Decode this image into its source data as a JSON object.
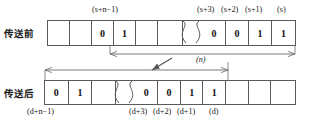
{
  "figure": {
    "rows": [
      {
        "name": "before",
        "label": "传送前",
        "cells": [
          "",
          "",
          "0",
          "1",
          "",
          "",
          "BREAK",
          "0",
          "0",
          "1",
          "1"
        ],
        "tick_labels_above": [
          "(s+n−1)",
          "(s+3)",
          "(s+2)",
          "(s+1)",
          "(s)"
        ]
      },
      {
        "name": "after",
        "label": "传送后",
        "cells": [
          "0",
          "1",
          "",
          "BREAK",
          "0",
          "0",
          "1",
          "1",
          "",
          "",
          ""
        ],
        "tick_labels_below": [
          "(d+n−1)",
          "(d+3)",
          "(d+2)",
          "(d+1)",
          "(d)"
        ]
      }
    ],
    "span_label_top": "(n)",
    "ticks": {
      "s_n_minus_1": "(s+n−1)",
      "s_plus_3": "(s+3)",
      "s_plus_2": "(s+2)",
      "s_plus_1": "(s+1)",
      "s": "(s)",
      "d_n_minus_1": "(d+n−1)",
      "d_plus_3": "(d+3)",
      "d_plus_2": "(d+2)",
      "d_plus_1": "(d+1)",
      "d": "(d)"
    },
    "colors": {
      "cell_border": "#5a5a5a",
      "arrow": "#6b6b6b",
      "text": "#1a1a1a",
      "background": "#ffffff"
    }
  }
}
